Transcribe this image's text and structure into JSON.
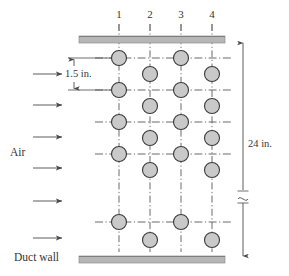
{
  "figure": {
    "colors": {
      "wall_fill": "#b6b6b6",
      "wall_edge": "#8f8f8f",
      "tube_fill": "#c9c9c9",
      "tube_stroke": "#3a3a3a",
      "line": "#4a4a4a",
      "centerline": "#5a5a5a",
      "text": "#363636",
      "background": "#ffffff"
    },
    "column_labels": [
      {
        "id": "col-1",
        "text": "1",
        "x": 118
      },
      {
        "id": "col-2",
        "text": "2",
        "x": 149
      },
      {
        "id": "col-3",
        "text": "3",
        "x": 180
      },
      {
        "id": "col-4",
        "text": "4",
        "x": 211
      }
    ],
    "annotations": {
      "pitch_dimension": "1.5 in.",
      "duct_height_dimension": "24 in.",
      "flow_label": "Air",
      "wall_label": "Duct wall"
    },
    "walls": {
      "top": {
        "x": 79,
        "y": 36,
        "width": 146,
        "height": 7
      },
      "bottom": {
        "x": 79,
        "y": 256,
        "width": 146,
        "height": 7
      }
    },
    "flow_arrows": [
      {
        "y": 74
      },
      {
        "y": 105
      },
      {
        "y": 137
      },
      {
        "y": 168
      },
      {
        "y": 201
      },
      {
        "y": 238
      }
    ],
    "columns": [
      {
        "label": "1",
        "x": 119,
        "tubes": [
          58,
          90,
          122,
          154,
          222
        ]
      },
      {
        "label": "2",
        "x": 150,
        "tubes": [
          74,
          106,
          138,
          170,
          240
        ]
      },
      {
        "label": "3",
        "x": 181,
        "tubes": [
          58,
          90,
          122,
          154,
          222
        ]
      },
      {
        "label": "4",
        "x": 212,
        "tubes": [
          74,
          106,
          138,
          170,
          240
        ]
      }
    ],
    "tube_radius": 7.5,
    "row_lines_y": [
      58,
      90,
      122,
      154,
      222
    ],
    "break_symbol_y": 196
  }
}
